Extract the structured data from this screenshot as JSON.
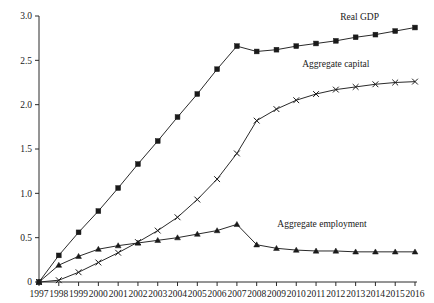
{
  "chart_data": {
    "type": "line",
    "title": "",
    "subtitle": "",
    "xlabel": "",
    "ylabel": "",
    "xlim": [
      1997,
      2016
    ],
    "ylim": [
      0,
      3.0
    ],
    "grid": false,
    "legend_position": "inline-right",
    "x": [
      1997,
      1998,
      1999,
      2000,
      2001,
      2002,
      2003,
      2004,
      2005,
      2006,
      2007,
      2008,
      2009,
      2010,
      2011,
      2012,
      2013,
      2014,
      2015,
      2016
    ],
    "x_tick_labels": [
      "1997",
      "1998",
      "1999",
      "2000",
      "2001",
      "2002",
      "2003",
      "2004",
      "2005",
      "2006",
      "2007",
      "2008",
      "2009",
      "2010",
      "2011",
      "2012",
      "2013",
      "2014",
      "2015",
      "2016"
    ],
    "y_tick_labels": [
      "0",
      "0.5",
      "1.0",
      "1.5",
      "2.0",
      "2.5",
      "3.0"
    ],
    "y_ticks": [
      0,
      0.5,
      1.0,
      1.5,
      2.0,
      2.5,
      3.0
    ],
    "series": [
      {
        "name": "Real GDP",
        "marker": "square",
        "color": "#1a1a1a",
        "label_x": 2013.2,
        "label_y": 2.95,
        "values": [
          0.0,
          0.3,
          0.56,
          0.8,
          1.06,
          1.33,
          1.59,
          1.86,
          2.12,
          2.4,
          2.66,
          2.6,
          2.62,
          2.66,
          2.69,
          2.72,
          2.76,
          2.79,
          2.83,
          2.87
        ]
      },
      {
        "name": "Aggregate capital",
        "marker": "cross",
        "color": "#1a1a1a",
        "label_x": 2012.0,
        "label_y": 2.42,
        "values": [
          0.0,
          0.02,
          0.11,
          0.22,
          0.33,
          0.45,
          0.58,
          0.73,
          0.93,
          1.16,
          1.45,
          1.82,
          1.95,
          2.05,
          2.12,
          2.17,
          2.2,
          2.23,
          2.25,
          2.26
        ]
      },
      {
        "name": "Aggregate employment",
        "marker": "triangle",
        "color": "#1a1a1a",
        "label_x": 2011.3,
        "label_y": 0.62,
        "values": [
          0.0,
          0.19,
          0.29,
          0.37,
          0.41,
          0.44,
          0.47,
          0.5,
          0.54,
          0.58,
          0.65,
          0.42,
          0.38,
          0.36,
          0.35,
          0.35,
          0.34,
          0.34,
          0.34,
          0.34
        ]
      }
    ]
  }
}
